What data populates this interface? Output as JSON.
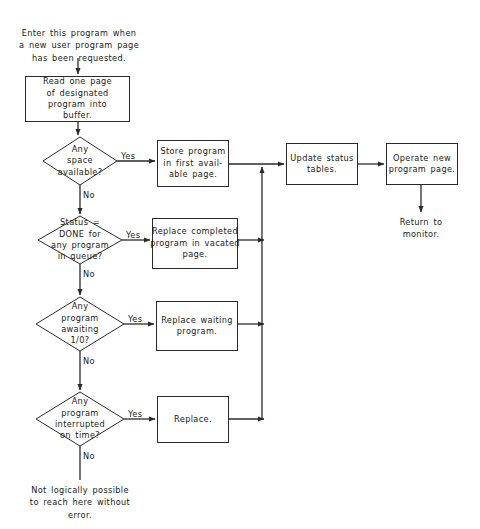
{
  "diagram": {
    "type": "flowchart",
    "title_note": "Program page loading flowchart",
    "entry_note": "Enter this program when\na new user program page\nhas been requested.",
    "exit_note": "Return to\nmonitor.",
    "terminal_note": "Not logically possible\nto reach here without\nerror.",
    "process_nodes": [
      {
        "id": "read-page",
        "label": "Read one page\nof designated\nprogram into\nbuffer."
      },
      {
        "id": "store-program",
        "label": "Store program\nin first avail-\nable page."
      },
      {
        "id": "replace-completed",
        "label": "Replace completed\nprogram in vacated\npage."
      },
      {
        "id": "replace-waiting",
        "label": "Replace waiting\nprogram."
      },
      {
        "id": "replace",
        "label": "Replace."
      },
      {
        "id": "update-status",
        "label": "Update status\ntables."
      },
      {
        "id": "operate-new",
        "label": "Operate new\nprogram page."
      }
    ],
    "decision_nodes": [
      {
        "id": "any-space",
        "label": "Any\nspace\navailable?",
        "yes": "Yes",
        "no": "No"
      },
      {
        "id": "status-done",
        "label": "Status =\nDONE for\nany program\nin queue?",
        "yes": "Yes",
        "no": "No"
      },
      {
        "id": "awaiting-io",
        "label": "Any\nprogram\nawaiting\n1/0?",
        "yes": "Yes",
        "no": "No"
      },
      {
        "id": "interrupted-time",
        "label": "Any\nprogram\ninterrupted\non time?",
        "yes": "Yes",
        "no": "No"
      }
    ],
    "colors": {
      "background": "#ffffff",
      "stroke": "#2a2a2a",
      "text": "#1a1a1a"
    }
  }
}
